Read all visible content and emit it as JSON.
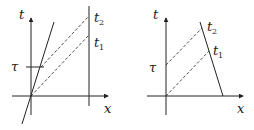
{
  "figure": {
    "left_panel": {
      "t_axis_label": "t",
      "x_axis_label": "x",
      "tau_label": "τ",
      "t2_label": "t",
      "t2_sub": "2",
      "t1_label": "t",
      "t1_sub": "1"
    },
    "right_panel": {
      "t_axis_label": "t",
      "x_axis_label": "x",
      "tau_label": "τ",
      "t2_label": "t",
      "t2_sub": "2",
      "t1_label": "t",
      "t1_sub": "1"
    },
    "colors": {
      "line": "#222222",
      "background": "#ffffff"
    }
  }
}
